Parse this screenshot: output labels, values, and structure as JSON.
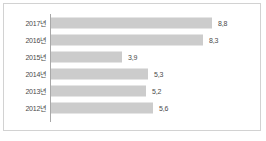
{
  "chart_data": {
    "type": "bar",
    "orientation": "horizontal",
    "title": "",
    "subtitle": "",
    "xlabel": "",
    "ylabel": "",
    "categories": [
      "2017년",
      "2016년",
      "2015년",
      "2014년",
      "2013년",
      "2012년"
    ],
    "values": [
      8.8,
      8.3,
      3.9,
      5.3,
      5.2,
      5.6
    ],
    "value_labels": [
      "8,8",
      "8,3",
      "3,9",
      "5,3",
      "5,2",
      "5,6"
    ],
    "xlim": [
      0,
      9.9
    ],
    "grid": false,
    "legend": null,
    "series": [
      {
        "name": "",
        "values": [
          8.8,
          8.3,
          3.9,
          5.3,
          5.2,
          5.6
        ]
      }
    ]
  },
  "style": {
    "bar_color": "#cccccc",
    "axis_color": "#a8a8a8",
    "frame_color": "#d2d2d2",
    "text_color": "#4a4a4a",
    "background": "#ffffff"
  }
}
